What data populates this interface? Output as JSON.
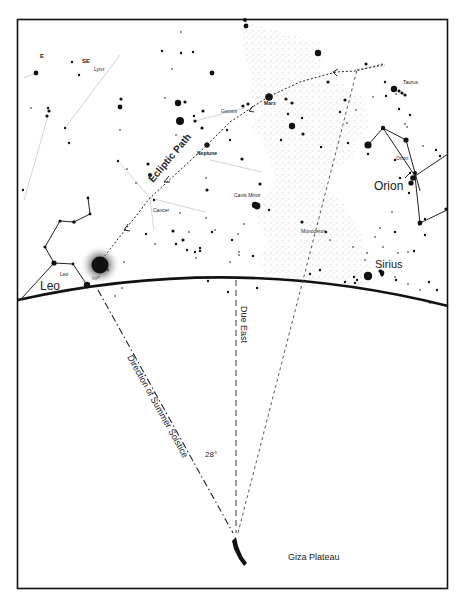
{
  "diagram": {
    "colors": {
      "ink": "#111111",
      "paper": "#ffffff",
      "milky_way": "#9a9a9a",
      "faint_line": "#c8c8c8"
    },
    "labels": {
      "compass_e": "E",
      "compass_se": "SE",
      "lynx": "Lynx",
      "gemini": "Gemini",
      "mars": "Mars",
      "taurus": "Taurus",
      "neptune": "Neptune",
      "ecliptic_path": "Ecliptic Path",
      "orion_small": "Orion",
      "orion_large": "Orion",
      "canis_minor": "Canis Minor",
      "cancer": "Cancer",
      "monoceros": "Monoceros",
      "sirius": "Sirius",
      "leo_small": "Leo",
      "leo_large": "Leo",
      "sun": "Sun",
      "due_east": "Due East",
      "summer_solstice": "Direction of Summer Solstice",
      "angle": "28°",
      "giza_plateau": "Giza Plateau"
    },
    "angle_between_lines_deg": 28,
    "stars": [
      [
        36,
        73,
        3
      ],
      [
        72,
        62,
        1.5
      ],
      [
        79,
        75,
        1.5
      ],
      [
        48,
        108,
        1.5
      ],
      [
        31,
        108,
        1
      ],
      [
        49,
        111,
        2
      ],
      [
        47,
        116,
        2
      ],
      [
        65,
        128,
        1.5
      ],
      [
        69,
        143,
        1.5
      ],
      [
        121,
        99,
        2
      ],
      [
        120,
        107,
        3
      ],
      [
        120,
        130,
        1
      ],
      [
        181,
        32,
        1
      ],
      [
        162,
        51,
        1.5
      ],
      [
        181,
        53,
        1.5
      ],
      [
        172,
        69,
        1
      ],
      [
        193,
        52,
        1.5
      ],
      [
        212,
        73,
        3
      ],
      [
        178,
        103,
        4
      ],
      [
        185,
        102,
        2
      ],
      [
        180,
        121,
        5
      ],
      [
        194,
        116,
        1.5
      ],
      [
        165,
        98,
        1
      ],
      [
        203,
        111,
        2
      ],
      [
        195,
        121,
        2
      ],
      [
        202,
        128,
        2
      ],
      [
        176,
        135,
        1
      ],
      [
        207,
        145,
        3
      ],
      [
        227,
        130,
        1.5
      ],
      [
        230,
        140,
        1.5
      ],
      [
        148,
        164,
        2
      ],
      [
        150,
        175,
        2.5
      ],
      [
        118,
        161,
        1.5
      ],
      [
        127,
        169,
        1
      ],
      [
        136,
        183,
        1
      ],
      [
        154,
        200,
        1.5
      ],
      [
        146,
        234,
        1.5
      ],
      [
        155,
        244,
        1
      ],
      [
        173,
        231,
        2
      ],
      [
        176,
        244,
        1.5
      ],
      [
        183,
        240,
        2
      ],
      [
        187,
        250,
        1.5
      ],
      [
        195,
        252,
        1.5
      ],
      [
        196,
        258,
        1
      ],
      [
        200,
        248,
        1.5
      ],
      [
        200,
        251,
        1.5
      ],
      [
        206,
        178,
        1
      ],
      [
        207,
        190,
        2
      ],
      [
        180,
        213,
        1
      ],
      [
        189,
        232,
        1
      ],
      [
        232,
        240,
        1.5
      ],
      [
        238,
        234,
        1
      ],
      [
        239,
        255,
        1
      ],
      [
        245,
        20,
        2.5
      ],
      [
        246,
        26,
        3
      ],
      [
        318,
        53,
        4
      ],
      [
        243,
        106,
        2
      ],
      [
        248,
        104,
        2
      ],
      [
        269,
        97,
        4.5
      ],
      [
        286,
        99,
        2
      ],
      [
        292,
        103,
        2
      ],
      [
        288,
        114,
        1.5
      ],
      [
        292,
        126,
        4
      ],
      [
        303,
        134,
        2
      ],
      [
        281,
        140,
        1.5
      ],
      [
        302,
        118,
        1.5
      ],
      [
        328,
        82,
        2
      ],
      [
        340,
        112,
        1.5
      ],
      [
        345,
        100,
        2
      ],
      [
        347,
        123,
        1
      ],
      [
        356,
        110,
        1
      ],
      [
        368,
        154,
        1.5
      ],
      [
        321,
        147,
        1.5
      ],
      [
        348,
        143,
        1.5
      ],
      [
        302,
        222,
        2
      ],
      [
        326,
        232,
        1.5
      ],
      [
        330,
        240,
        1
      ],
      [
        353,
        247,
        1
      ],
      [
        354,
        277,
        1.5
      ],
      [
        357,
        280,
        1.5
      ],
      [
        242,
        159,
        2
      ],
      [
        260,
        184,
        2
      ],
      [
        255,
        205,
        4
      ],
      [
        269,
        210,
        1.5
      ],
      [
        244,
        224,
        1
      ],
      [
        239,
        252,
        1
      ],
      [
        253,
        256,
        1.5
      ],
      [
        230,
        262,
        1
      ],
      [
        206,
        218,
        1
      ],
      [
        215,
        230,
        1
      ],
      [
        366,
        64,
        2
      ],
      [
        385,
        82,
        1.5
      ],
      [
        394,
        89,
        4
      ],
      [
        399,
        91,
        2
      ],
      [
        402,
        93,
        2
      ],
      [
        405,
        95,
        2
      ],
      [
        396,
        94,
        1
      ],
      [
        399,
        109,
        1.5
      ],
      [
        410,
        115,
        1.5
      ],
      [
        407,
        127,
        1
      ],
      [
        405,
        124,
        1
      ],
      [
        373,
        97,
        1
      ],
      [
        386,
        96,
        1.5
      ],
      [
        395,
        160,
        1.5
      ],
      [
        400,
        178,
        1.5
      ],
      [
        410,
        173,
        1.5
      ],
      [
        423,
        146,
        1
      ],
      [
        436,
        150,
        1.5
      ],
      [
        440,
        156,
        1.5
      ],
      [
        409,
        193,
        1.5
      ],
      [
        425,
        219,
        1.5
      ],
      [
        425,
        235,
        1.5
      ],
      [
        414,
        251,
        1.5
      ],
      [
        429,
        282,
        1.5
      ],
      [
        437,
        290,
        1.5
      ],
      [
        380,
        228,
        1
      ],
      [
        395,
        232,
        1.5
      ],
      [
        392,
        212,
        1
      ],
      [
        381,
        271,
        2
      ],
      [
        382,
        275,
        2
      ],
      [
        395,
        277,
        1
      ],
      [
        368,
        276,
        5
      ],
      [
        380,
        271,
        2
      ],
      [
        355,
        283,
        1.5
      ],
      [
        383,
        247,
        1
      ],
      [
        367,
        253,
        1
      ],
      [
        365,
        260,
        1
      ],
      [
        375,
        237,
        1
      ],
      [
        398,
        253,
        1
      ],
      [
        408,
        252,
        1
      ],
      [
        419,
        225,
        1
      ],
      [
        396,
        280,
        1.5
      ],
      [
        408,
        284,
        1
      ],
      [
        420,
        290,
        1
      ],
      [
        430,
        303,
        1
      ],
      [
        310,
        274,
        1.5
      ],
      [
        320,
        270,
        1.5
      ],
      [
        345,
        282,
        1.5
      ],
      [
        257,
        288,
        1.5
      ],
      [
        228,
        292,
        1.5
      ],
      [
        208,
        281,
        1.5
      ],
      [
        240,
        278,
        1
      ],
      [
        23,
        190,
        1.5
      ],
      [
        115,
        296,
        1
      ],
      [
        122,
        288,
        1
      ],
      [
        108,
        270,
        1.5
      ],
      [
        124,
        262,
        1
      ],
      [
        212,
        232,
        1.5
      ]
    ],
    "leo_figure": [
      [
        22,
        299
      ],
      [
        54,
        263
      ],
      [
        45,
        247
      ],
      [
        60,
        221
      ],
      [
        74,
        222
      ],
      [
        90,
        214
      ],
      [
        88,
        198
      ]
    ],
    "leo_lower": [
      [
        54,
        263
      ],
      [
        73,
        264
      ],
      [
        87,
        285
      ]
    ],
    "leo_left": [
      [
        22,
        281
      ],
      [
        54,
        263
      ]
    ],
    "orion_figure": [
      [
        388,
        148
      ],
      [
        366,
        185
      ],
      [
        384,
        187
      ],
      [
        389,
        185
      ],
      [
        393,
        189
      ],
      [
        394,
        188
      ],
      [
        400,
        223
      ],
      [
        447,
        207
      ],
      [
        395,
        177
      ],
      [
        418,
        188
      ]
    ]
  }
}
